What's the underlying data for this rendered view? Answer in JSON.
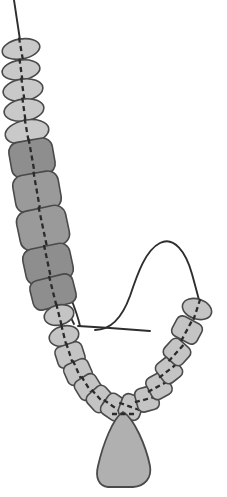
{
  "image": {
    "title": "Beaded necklace threading diagram",
    "subject": "necklace",
    "background_color": "#ffffff",
    "width": 227,
    "height": 497
  },
  "palette": {
    "bead_light": "#c9c9c9",
    "bead_medium": "#b3b3b3",
    "bead_dark": "#8e8e8e",
    "bead_outline": "#4a4a4a",
    "thread": "#2e2e2e",
    "pendant_fill": "#b0b0b0",
    "pendant_outline": "#4a4a4a"
  },
  "parts": {
    "thread_label": "beading-thread",
    "needle_label": "beading-needle",
    "pendant_label": "teardrop-pendant",
    "strand_label": "bead-strand"
  },
  "beads": [
    {
      "id": "bead-01",
      "cx": 21,
      "cy": 49,
      "rx": 19,
      "ry": 10,
      "rot": -10,
      "fill": "#c9c9c9",
      "shape": "oval"
    },
    {
      "id": "bead-02",
      "cx": 21,
      "cy": 70,
      "rx": 19,
      "ry": 10,
      "rot": -8,
      "fill": "#c9c9c9",
      "shape": "oval"
    },
    {
      "id": "bead-03",
      "cx": 23,
      "cy": 90,
      "rx": 20,
      "ry": 11,
      "rot": -8,
      "fill": "#c9c9c9",
      "shape": "oval"
    },
    {
      "id": "bead-04",
      "cx": 24,
      "cy": 110,
      "rx": 20,
      "ry": 11,
      "rot": -8,
      "fill": "#c9c9c9",
      "shape": "oval"
    },
    {
      "id": "bead-05",
      "cx": 27,
      "cy": 132,
      "rx": 22,
      "ry": 12,
      "rot": -10,
      "fill": "#c9c9c9",
      "shape": "oval"
    },
    {
      "id": "bead-06",
      "cx": 32,
      "cy": 158,
      "rx": 22,
      "ry": 18,
      "rot": -10,
      "fill": "#8e8e8e",
      "shape": "square"
    },
    {
      "id": "bead-07",
      "cx": 37,
      "cy": 192,
      "rx": 23,
      "ry": 19,
      "rot": -10,
      "fill": "#9a9a9a",
      "shape": "square"
    },
    {
      "id": "bead-08",
      "cx": 43,
      "cy": 228,
      "rx": 25,
      "ry": 20,
      "rot": -12,
      "fill": "#9a9a9a",
      "shape": "square"
    },
    {
      "id": "bead-09",
      "cx": 48,
      "cy": 264,
      "rx": 24,
      "ry": 18,
      "rot": -12,
      "fill": "#8e8e8e",
      "shape": "square"
    },
    {
      "id": "bead-10",
      "cx": 53,
      "cy": 292,
      "rx": 22,
      "ry": 15,
      "rot": -14,
      "fill": "#8e8e8e",
      "shape": "square"
    },
    {
      "id": "bead-11",
      "cx": 59,
      "cy": 315,
      "rx": 15,
      "ry": 10,
      "rot": -14,
      "fill": "#c4c4c4",
      "shape": "oval"
    },
    {
      "id": "bead-12",
      "cx": 64,
      "cy": 336,
      "rx": 15,
      "ry": 10,
      "rot": -14,
      "fill": "#c4c4c4",
      "shape": "oval"
    },
    {
      "id": "bead-13",
      "cx": 70,
      "cy": 355,
      "rx": 14,
      "ry": 11,
      "rot": -18,
      "fill": "#c4c4c4",
      "shape": "square"
    },
    {
      "id": "bead-14",
      "cx": 78,
      "cy": 372,
      "rx": 13,
      "ry": 11,
      "rot": -24,
      "fill": "#c4c4c4",
      "shape": "square"
    },
    {
      "id": "bead-15",
      "cx": 88,
      "cy": 387,
      "rx": 12,
      "ry": 11,
      "rot": -32,
      "fill": "#c4c4c4",
      "shape": "square"
    },
    {
      "id": "bead-16",
      "cx": 100,
      "cy": 399,
      "rx": 12,
      "ry": 11,
      "rot": -42,
      "fill": "#c4c4c4",
      "shape": "square"
    },
    {
      "id": "bead-17",
      "cx": 114,
      "cy": 407,
      "rx": 12,
      "ry": 11,
      "rot": -55,
      "fill": "#c4c4c4",
      "shape": "square"
    },
    {
      "id": "bead-18",
      "cx": 131,
      "cy": 407,
      "rx": 12,
      "ry": 11,
      "rot": -70,
      "fill": "#c4c4c4",
      "shape": "square"
    },
    {
      "id": "bead-19",
      "cx": 147,
      "cy": 399,
      "rx": 12,
      "ry": 11,
      "rot": -105,
      "fill": "#c4c4c4",
      "shape": "square"
    },
    {
      "id": "bead-20",
      "cx": 159,
      "cy": 386,
      "rx": 12,
      "ry": 11,
      "rot": -118,
      "fill": "#c4c4c4",
      "shape": "square"
    },
    {
      "id": "bead-21",
      "cx": 169,
      "cy": 370,
      "rx": 12,
      "ry": 11,
      "rot": -128,
      "fill": "#c4c4c4",
      "shape": "square"
    },
    {
      "id": "bead-22",
      "cx": 177,
      "cy": 352,
      "rx": 12,
      "ry": 11,
      "rot": -138,
      "fill": "#c4c4c4",
      "shape": "square"
    },
    {
      "id": "bead-23",
      "cx": 187,
      "cy": 330,
      "rx": 14,
      "ry": 11,
      "rot": -152,
      "fill": "#c4c4c4",
      "shape": "square"
    },
    {
      "id": "bead-24",
      "cx": 197,
      "cy": 309,
      "rx": 15,
      "ry": 10,
      "rot": -162,
      "fill": "#c4c4c4",
      "shape": "oval"
    }
  ],
  "threads": [
    {
      "id": "thread-top-tail",
      "d": "M 14 0 L 17 20 L 20 40"
    },
    {
      "id": "thread-needle-arc",
      "d": "M 95 330 C 110 330 122 318 130 296 C 138 272 146 250 160 243 C 174 236 186 252 192 274 C 197 292 199 300 200 304"
    },
    {
      "id": "thread-needle-shaft",
      "d": "M 78 326 L 110 328 L 150 331"
    },
    {
      "id": "thread-loop-left",
      "d": "M 62 298 C 66 308 70 316 74 324"
    },
    {
      "id": "thread-loop-right",
      "d": "M 70 296 C 74 306 78 316 80 326"
    }
  ],
  "pendant": {
    "id": "pendant-teardrop",
    "d": "M 123 412 C 134 418 146 446 150 466 C 152 478 145 486 133 487 L 108 487 C 99 486 95 478 98 466 C 103 444 113 418 123 412 Z",
    "fill": "#b0b0b0"
  }
}
